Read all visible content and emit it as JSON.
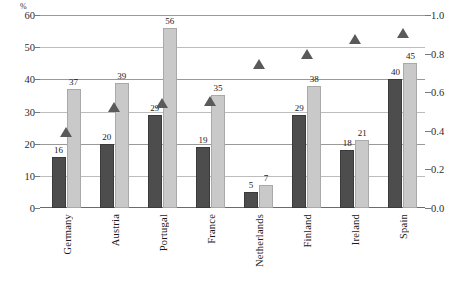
{
  "chart_data": {
    "type": "bar",
    "title": "",
    "xlabel": "",
    "ylabel": "%",
    "categories": [
      "Germany",
      "Austria",
      "Portugal",
      "France",
      "Netherlands",
      "Finland",
      "Ireland",
      "Spain"
    ],
    "ylim": [
      0,
      60
    ],
    "y_ticks": [
      "0",
      "10",
      "20",
      "30",
      "40",
      "50",
      "60"
    ],
    "y_tick_values": [
      0,
      10,
      20,
      30,
      40,
      50,
      60
    ],
    "y2lim": [
      0.0,
      1.0
    ],
    "y2_ticks": [
      "0.0",
      "0.2",
      "0.4",
      "0.6",
      "0.8",
      "1.0"
    ],
    "y2_tick_values": [
      0.0,
      0.2,
      0.4,
      0.6,
      0.8,
      1.0
    ],
    "grid": true,
    "legend": "none",
    "series": [
      {
        "name": "dark-bar-series",
        "kind": "bar",
        "axis": "left",
        "color": "#4d4d4d",
        "values": [
          16,
          20,
          29,
          19,
          5,
          29,
          18,
          40
        ],
        "labels": [
          "16",
          "20",
          "29",
          "19",
          "5",
          "29",
          "18",
          "40"
        ]
      },
      {
        "name": "light-bar-series",
        "kind": "bar",
        "axis": "left",
        "color": "#c9c9c9",
        "values": [
          37,
          39,
          56,
          35,
          7,
          38,
          21,
          45
        ],
        "labels": [
          "37",
          "39",
          "56",
          "35",
          "7",
          "38",
          "21",
          "45"
        ]
      },
      {
        "name": "triangle-marker-series",
        "kind": "scatter",
        "axis": "right",
        "marker": "triangle-up",
        "color": "#5a5a5a",
        "values": [
          0.37,
          0.5,
          0.52,
          0.53,
          0.72,
          0.77,
          0.85,
          0.88
        ]
      }
    ]
  }
}
